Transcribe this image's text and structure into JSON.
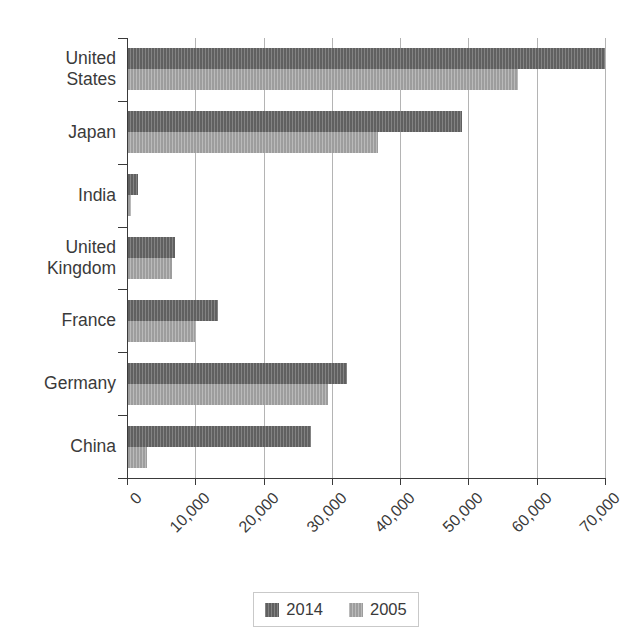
{
  "chart_data": {
    "type": "bar",
    "orientation": "horizontal",
    "title": "",
    "xlabel": "",
    "ylabel": "",
    "categories": [
      "United States",
      "Japan",
      "India",
      "United Kingdom",
      "France",
      "Germany",
      "China"
    ],
    "series": [
      {
        "name": "2014",
        "color": "#6b6b6b",
        "values": [
          70000,
          49000,
          1600,
          7000,
          13300,
          32200,
          26900
        ]
      },
      {
        "name": "2005",
        "color": "#a9a9a9",
        "values": [
          57200,
          36700,
          600,
          6600,
          10000,
          29400,
          3000
        ]
      }
    ],
    "xlim": [
      0,
      70000
    ],
    "xticks": [
      0,
      10000,
      20000,
      30000,
      40000,
      50000,
      60000,
      70000
    ],
    "xticklabels": [
      "0",
      "10,000",
      "20,000",
      "30,000",
      "40,000",
      "50,000",
      "60,000",
      "70,000"
    ],
    "grid": true,
    "grid_axis": "x",
    "legend_position": "bottom"
  },
  "y_axis": {
    "labels": [
      "United\nStates",
      "Japan",
      "India",
      "United\nKingdom",
      "France",
      "Germany",
      "China"
    ]
  },
  "x_axis": {
    "labels": [
      "0",
      "10,000",
      "20,000",
      "30,000",
      "40,000",
      "50,000",
      "60,000",
      "70,000"
    ]
  },
  "legend": {
    "entries": [
      {
        "label": "2014",
        "color": "#6b6b6b"
      },
      {
        "label": "2005",
        "color": "#a9a9a9"
      }
    ]
  }
}
